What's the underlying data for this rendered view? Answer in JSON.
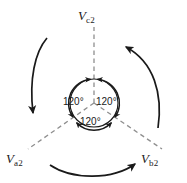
{
  "figure": {
    "stroke_color": "#1a1a1a",
    "dash_color": "#8c8c8c",
    "background": "#ffffff"
  },
  "phasors": [
    {
      "name": "v-c2",
      "symbol": "V",
      "subscript": "c2",
      "direction": "up",
      "angle_deg": 90
    },
    {
      "name": "v-a2",
      "symbol": "V",
      "subscript": "a2",
      "direction": "down-left",
      "angle_deg": 210
    },
    {
      "name": "v-b2",
      "symbol": "V",
      "subscript": "b2",
      "direction": "down-right",
      "angle_deg": 330
    }
  ],
  "angles": [
    {
      "name": "angle-left",
      "value": "120°"
    },
    {
      "name": "angle-right",
      "value": "120°"
    },
    {
      "name": "angle-bottom",
      "value": "120°"
    }
  ],
  "rotation_arrows": [
    {
      "name": "rotation-arrow-left",
      "points": "down"
    },
    {
      "name": "rotation-arrow-right",
      "points": "up-left"
    },
    {
      "name": "rotation-arrow-bottom",
      "points": "right"
    }
  ],
  "geometry": {
    "center_x": 94,
    "center_y": 103,
    "inner_radius": 24
  }
}
